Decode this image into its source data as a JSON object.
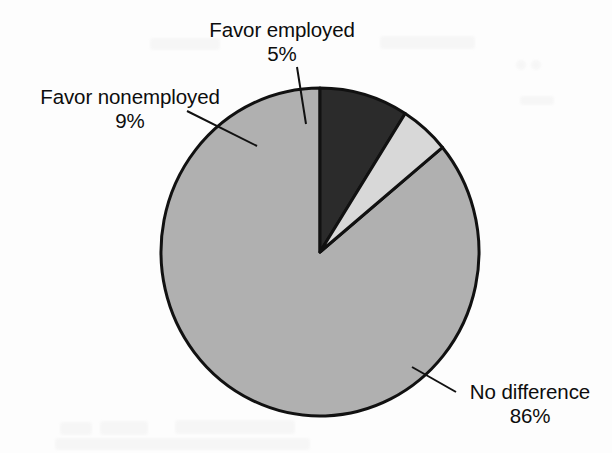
{
  "page": {
    "background_color": "#fdfdfd",
    "text_color": "#0d0d0d"
  },
  "chart_data": {
    "type": "pie",
    "title": "",
    "subtitle": "",
    "xlabel": "",
    "ylabel": "",
    "legend_position": "none",
    "grid": false,
    "labels_position": "outside-with-leader-lines",
    "start_angle_deg": 90,
    "direction": "counterclockwise",
    "geometry": {
      "center_x": 320,
      "center_y": 252,
      "radius_x": 159,
      "radius_y": 164,
      "outline_color": "#111111",
      "outline_width": 3
    },
    "categories": [
      "No difference",
      "Favor employed",
      "Favor nonemployed"
    ],
    "values": [
      86,
      5,
      9
    ],
    "value_suffix": "%",
    "slices": [
      {
        "name": "No difference",
        "label": "No difference",
        "value": 86,
        "value_text": "86%",
        "color": "#b0b0b0",
        "leader_line": {
          "x1": 412,
          "y1": 367,
          "x2": 456,
          "y2": 392
        }
      },
      {
        "name": "Favor employed",
        "label": "Favor employed",
        "value": 5,
        "value_text": "5%",
        "color": "#d8d8d8",
        "leader_line": {
          "x1": 297,
          "y1": 67,
          "x2": 306,
          "y2": 124
        }
      },
      {
        "name": "Favor nonemployed",
        "label": "Favor nonemployed",
        "value": 9,
        "value_text": "9%",
        "color": "#2b2b2b",
        "leader_line": {
          "x1": 187,
          "y1": 111,
          "x2": 257,
          "y2": 146
        }
      }
    ]
  }
}
